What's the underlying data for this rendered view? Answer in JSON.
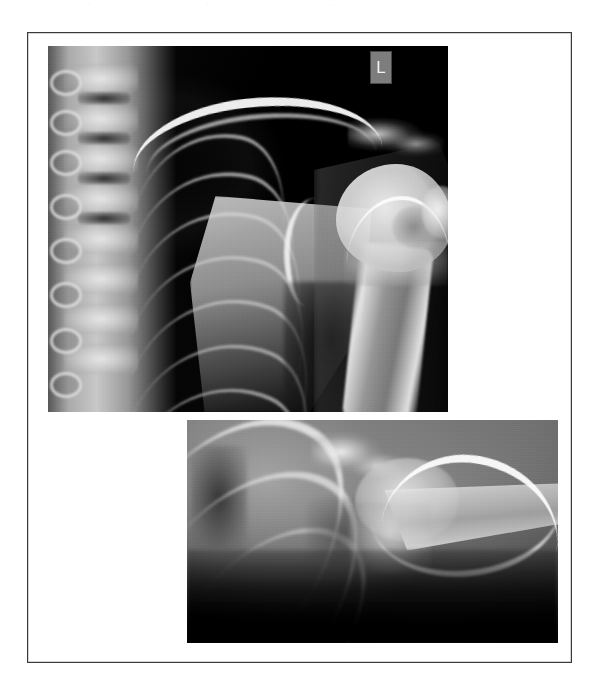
{
  "page": {
    "background_color": "#ffffff",
    "width": 606,
    "height": 690
  },
  "top_artifacts": {
    "fragment_1": "·",
    "fragment_2": "·",
    "fragment_3": "·"
  },
  "figure": {
    "frame_color": "#3a3a3c",
    "panels": [
      {
        "name": "ap-shoulder-radiograph",
        "view": "AP",
        "modality": "X-ray",
        "region": "left shoulder",
        "marker_label": "L",
        "marker_background": "#7d7d7d",
        "marker_text_color": "#efefef",
        "background_color": "#000000"
      },
      {
        "name": "axillary-shoulder-radiograph",
        "view": "axillary / lateral",
        "modality": "X-ray",
        "region": "left shoulder",
        "background_color": "#7a7a7a"
      }
    ]
  },
  "bottom_artifact": {
    "text": "·"
  }
}
